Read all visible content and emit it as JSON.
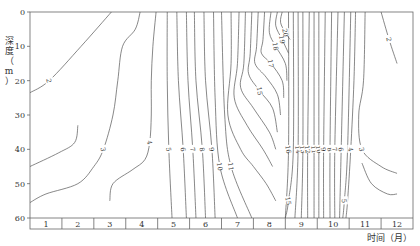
{
  "chart_data": {
    "type": "contour",
    "title": "",
    "xlabel": "时间（月）",
    "ylabel": "深度（m）",
    "x_categories": [
      "1",
      "2",
      "3",
      "4",
      "5",
      "6",
      "7",
      "8",
      "9",
      "10",
      "11",
      "12"
    ],
    "y_ticks": [
      0,
      10,
      20,
      30,
      40,
      50,
      60
    ],
    "ylim": [
      0,
      60
    ],
    "y_inverted": true,
    "grid": false,
    "contour_levels": [
      2,
      3,
      4,
      5,
      6,
      7,
      8,
      9,
      10,
      11,
      12,
      13,
      14,
      15,
      16,
      17,
      18,
      19,
      20
    ],
    "contours": [
      {
        "level": 2,
        "label": "2",
        "points": [
          [
            3.55,
            0
          ],
          [
            2.6,
            10
          ],
          [
            1.6,
            20
          ],
          [
            1.0,
            23.5
          ]
        ]
      },
      {
        "level": 2,
        "label_note": "lower-left",
        "points": [
          [
            1.0,
            45
          ],
          [
            1.9,
            41
          ],
          [
            2.4,
            38
          ],
          [
            2.5,
            33
          ]
        ]
      },
      {
        "level": 3,
        "label": "3",
        "points": [
          [
            4.45,
            0
          ],
          [
            4.3,
            5
          ],
          [
            3.9,
            10
          ],
          [
            3.75,
            20
          ],
          [
            3.6,
            30
          ],
          [
            3.3,
            40
          ],
          [
            3.0,
            45
          ],
          [
            2.5,
            50
          ],
          [
            1.5,
            53
          ],
          [
            1.0,
            55.5
          ]
        ]
      },
      {
        "level": 4,
        "label": "4",
        "points": [
          [
            4.95,
            0
          ],
          [
            4.85,
            10
          ],
          [
            4.8,
            20
          ],
          [
            4.8,
            30
          ],
          [
            4.75,
            38
          ],
          [
            4.6,
            43
          ],
          [
            4.2,
            46
          ],
          [
            3.6,
            50
          ],
          [
            3.5,
            55
          ]
        ]
      },
      {
        "level": 5,
        "label": "5",
        "points": [
          [
            5.3,
            0
          ],
          [
            5.3,
            20
          ],
          [
            5.35,
            40
          ],
          [
            5.45,
            60
          ]
        ]
      },
      {
        "level": 6,
        "label": "6",
        "points": [
          [
            5.6,
            0
          ],
          [
            5.65,
            20
          ],
          [
            5.8,
            40
          ],
          [
            5.9,
            60
          ]
        ]
      },
      {
        "level": 7,
        "label": "7",
        "points": [
          [
            5.9,
            0
          ],
          [
            5.95,
            20
          ],
          [
            6.1,
            40
          ],
          [
            6.2,
            60
          ]
        ]
      },
      {
        "level": 8,
        "label": "8",
        "points": [
          [
            6.15,
            0
          ],
          [
            6.2,
            20
          ],
          [
            6.4,
            40
          ],
          [
            6.5,
            60
          ]
        ]
      },
      {
        "level": 9,
        "label": "9",
        "points": [
          [
            6.45,
            0
          ],
          [
            6.5,
            20
          ],
          [
            6.7,
            40
          ],
          [
            6.8,
            60
          ]
        ]
      },
      {
        "level": 10,
        "label": "10",
        "points": [
          [
            6.75,
            0
          ],
          [
            6.8,
            25
          ],
          [
            6.95,
            45
          ],
          [
            7.5,
            60
          ]
        ]
      },
      {
        "level": 11,
        "label": "11",
        "points": [
          [
            7.0,
            0
          ],
          [
            7.1,
            30
          ],
          [
            7.3,
            45
          ],
          [
            7.95,
            60
          ]
        ]
      },
      {
        "level": 12,
        "points": [
          [
            7.3,
            0
          ],
          [
            7.3,
            15
          ],
          [
            7.2,
            30
          ],
          [
            7.6,
            40
          ],
          [
            8.0,
            45
          ],
          [
            8.4,
            50
          ],
          [
            8.7,
            55
          ]
        ]
      },
      {
        "level": 13,
        "points": [
          [
            7.55,
            0
          ],
          [
            7.5,
            15
          ],
          [
            7.4,
            25
          ],
          [
            7.8,
            33
          ],
          [
            8.3,
            40
          ],
          [
            8.6,
            45
          ]
        ]
      },
      {
        "level": 14,
        "points": [
          [
            7.75,
            0
          ],
          [
            7.7,
            15
          ],
          [
            7.6,
            22
          ],
          [
            8.0,
            28
          ],
          [
            8.5,
            35
          ],
          [
            8.7,
            40
          ]
        ]
      },
      {
        "level": 15,
        "label": "15",
        "points": [
          [
            7.95,
            0
          ],
          [
            7.9,
            12
          ],
          [
            7.85,
            18
          ],
          [
            8.2,
            23
          ],
          [
            8.6,
            28
          ],
          [
            8.75,
            35
          ]
        ]
      },
      {
        "level": 16,
        "points": [
          [
            8.15,
            0
          ],
          [
            8.1,
            10
          ],
          [
            8.05,
            15
          ],
          [
            8.4,
            19
          ],
          [
            8.75,
            24
          ],
          [
            8.85,
            30
          ]
        ]
      },
      {
        "level": 17,
        "label": "17",
        "points": [
          [
            8.35,
            0
          ],
          [
            8.3,
            8
          ],
          [
            8.25,
            12
          ],
          [
            8.55,
            15
          ],
          [
            8.9,
            20
          ],
          [
            8.95,
            25
          ]
        ]
      },
      {
        "level": 18,
        "label": "18",
        "points": [
          [
            8.55,
            0
          ],
          [
            8.5,
            6
          ],
          [
            8.7,
            10
          ],
          [
            9.0,
            15
          ],
          [
            9.05,
            20
          ]
        ]
      },
      {
        "level": 19,
        "label": "19",
        "points": [
          [
            8.75,
            0
          ],
          [
            8.7,
            4
          ],
          [
            8.9,
            8
          ],
          [
            9.1,
            12
          ]
        ]
      },
      {
        "level": 20,
        "label": "20",
        "points": [
          [
            8.9,
            0
          ],
          [
            8.85,
            3
          ],
          [
            9.0,
            6
          ],
          [
            9.15,
            8
          ]
        ]
      },
      {
        "level": 16,
        "label": "16",
        "points": [
          [
            9.1,
            0
          ],
          [
            9.1,
            40
          ],
          [
            9.0,
            60
          ]
        ]
      },
      {
        "level": 15,
        "label": "15",
        "points": [
          [
            9.25,
            0
          ],
          [
            9.25,
            40
          ],
          [
            9.1,
            55
          ],
          [
            9.0,
            60
          ]
        ]
      },
      {
        "level": 14,
        "label": "14",
        "points": [
          [
            9.4,
            0
          ],
          [
            9.4,
            40
          ],
          [
            9.3,
            60
          ]
        ]
      },
      {
        "level": 13,
        "label": "13",
        "points": [
          [
            9.55,
            0
          ],
          [
            9.55,
            40
          ],
          [
            9.5,
            60
          ]
        ]
      },
      {
        "level": 12,
        "label": "12",
        "points": [
          [
            9.75,
            0
          ],
          [
            9.7,
            40
          ],
          [
            9.7,
            60
          ]
        ]
      },
      {
        "level": 11,
        "label": "11",
        "points": [
          [
            9.9,
            0
          ],
          [
            9.9,
            40
          ],
          [
            9.9,
            60
          ]
        ]
      },
      {
        "level": 10,
        "label": "10",
        "points": [
          [
            10.05,
            0
          ],
          [
            10.05,
            40
          ],
          [
            10.05,
            60
          ]
        ]
      },
      {
        "level": 9,
        "label": "9",
        "points": [
          [
            10.25,
            0
          ],
          [
            10.2,
            40
          ],
          [
            10.2,
            60
          ]
        ]
      },
      {
        "level": 8,
        "label": "8",
        "points": [
          [
            10.45,
            0
          ],
          [
            10.4,
            40
          ],
          [
            10.4,
            60
          ]
        ]
      },
      {
        "level": 7,
        "label": "7",
        "points": [
          [
            10.65,
            0
          ],
          [
            10.55,
            40
          ],
          [
            10.55,
            60
          ]
        ]
      },
      {
        "level": 6,
        "label": "6",
        "points": [
          [
            10.85,
            0
          ],
          [
            10.75,
            40
          ],
          [
            10.7,
            60
          ]
        ]
      },
      {
        "level": 5,
        "label": "5",
        "points": [
          [
            11.05,
            0
          ],
          [
            10.95,
            40
          ],
          [
            10.85,
            55
          ],
          [
            10.8,
            60
          ]
        ]
      },
      {
        "level": 4,
        "label": "4",
        "points": [
          [
            11.2,
            0
          ],
          [
            11.15,
            20
          ],
          [
            11.05,
            40
          ],
          [
            10.95,
            55
          ],
          [
            10.9,
            60
          ]
        ]
      },
      {
        "level": 3,
        "label": "3",
        "points": [
          [
            11.5,
            0
          ],
          [
            11.45,
            20
          ],
          [
            11.3,
            30
          ],
          [
            11.4,
            40
          ],
          [
            12.0,
            45
          ],
          [
            12.5,
            47
          ]
        ]
      },
      {
        "level": 2,
        "label": "2",
        "points": [
          [
            12.0,
            0
          ],
          [
            12.25,
            8
          ],
          [
            12.5,
            15
          ]
        ]
      },
      {
        "level": 2,
        "label_note": "lower-right",
        "points": [
          [
            11.4,
            44
          ],
          [
            11.7,
            50
          ],
          [
            12.2,
            53
          ],
          [
            12.5,
            53
          ]
        ]
      }
    ]
  },
  "axes": {
    "y_tick_labels": [
      "0",
      "10",
      "20",
      "30",
      "40",
      "50",
      "60"
    ],
    "month_labels": [
      "1",
      "2",
      "3",
      "4",
      "5",
      "6",
      "7",
      "8",
      "9",
      "10",
      "11",
      "12"
    ],
    "ylabel": "深度（m）",
    "xlabel": "时间（月）"
  }
}
